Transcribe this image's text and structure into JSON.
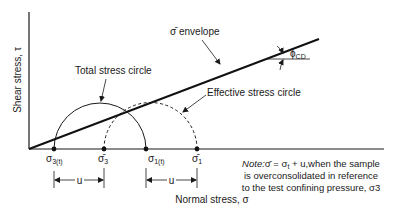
{
  "diagram": {
    "type": "mohr-circle",
    "axes": {
      "y_label": "Shear stress, τ",
      "x_label": "Normal stress, σ"
    },
    "envelope": {
      "label": "σ̄ envelope",
      "angle_label": "ϕ",
      "angle_subscript": "CD"
    },
    "circles": {
      "total": {
        "label": "Total stress circle",
        "style": "solid"
      },
      "effective": {
        "label": "Effective stress circle",
        "style": "dashed"
      }
    },
    "points": {
      "s3t": {
        "main": "σ",
        "sub": "3(t)"
      },
      "s3bar": {
        "main": "σ̄",
        "sub": "3"
      },
      "s1t": {
        "main": "σ",
        "sub": "1(t)"
      },
      "s1bar": {
        "main": "σ̄",
        "sub": "1"
      }
    },
    "offsets": {
      "left_u": "u",
      "right_u": "u"
    },
    "note": {
      "line1_italic": "Note:",
      "line1_rest_a": "σ̄ = σ",
      "line1_sub": "t",
      "line1_rest_b": " + u,when the sample",
      "line2": "is overconsolidated in reference",
      "line3": "to the test confining pressure, σ3"
    }
  }
}
